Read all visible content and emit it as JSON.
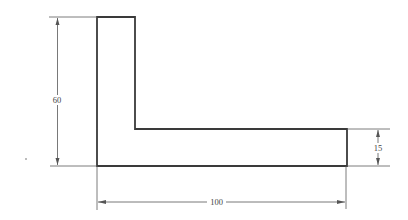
{
  "drawing": {
    "title": "L-shaped profile dimensioned drawing",
    "shape": "L-profile",
    "dimensions": {
      "height": {
        "label": "60",
        "value": 60,
        "orientation": "vertical"
      },
      "width": {
        "label": "100",
        "value": 100,
        "orientation": "horizontal"
      },
      "leg_thickness": {
        "label": "15",
        "value": 15,
        "orientation": "vertical"
      }
    },
    "colors": {
      "outline": "#3a3a3a",
      "dimension_line": "#6a6a6a",
      "background": "#ffffff"
    }
  }
}
